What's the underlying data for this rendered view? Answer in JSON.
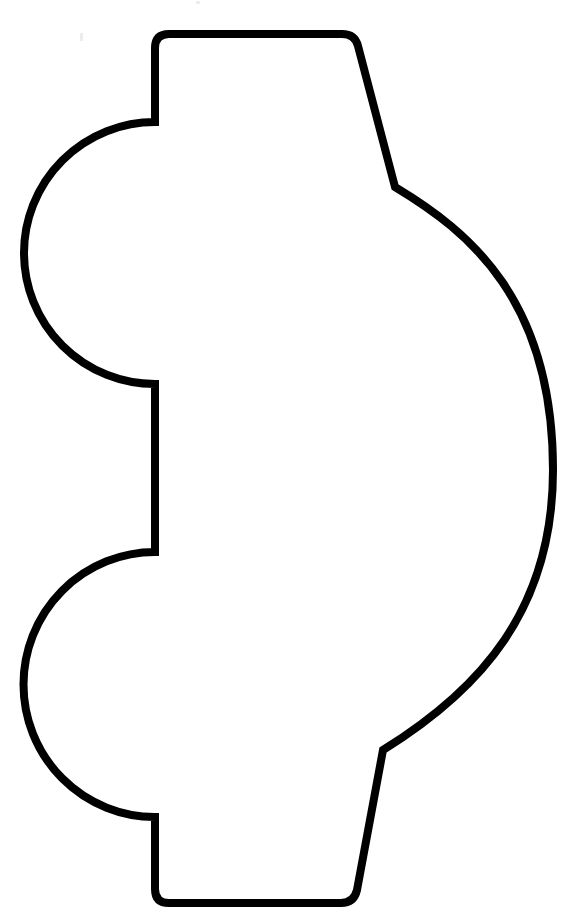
{
  "page": {
    "width": 569,
    "height": 919,
    "background": "#ffffff"
  },
  "drawing": {
    "subject": "car outline template (side view, rotated, wheels on left)",
    "stroke_color": "#000000",
    "stroke_width": 8,
    "fill": "#ffffff",
    "parts": [
      {
        "name": "roof",
        "description": "rounded rectangle top edge"
      },
      {
        "name": "upper-wheel",
        "description": "semicircle bulging left"
      },
      {
        "name": "lower-wheel",
        "description": "semicircle bulging left"
      },
      {
        "name": "body-curve",
        "description": "large curve bulging right"
      },
      {
        "name": "windshield-upper",
        "description": "slanted line top-right"
      },
      {
        "name": "windshield-lower",
        "description": "slanted line bottom-right"
      }
    ]
  }
}
